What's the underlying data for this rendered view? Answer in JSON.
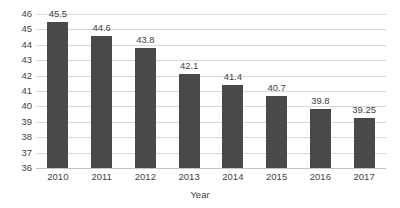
{
  "chart_data": {
    "type": "bar",
    "title": "",
    "xlabel": "Year",
    "ylabel": "Gallons",
    "categories": [
      "2010",
      "2011",
      "2012",
      "2013",
      "2014",
      "2015",
      "2016",
      "2017"
    ],
    "values": [
      45.5,
      44.6,
      43.8,
      42.1,
      41.4,
      40.7,
      39.8,
      39.25
    ],
    "data_labels": [
      "45.5",
      "44.6",
      "43.8",
      "42.1",
      "41.4",
      "40.7",
      "39.8",
      "39.25"
    ],
    "ylim": [
      36,
      46
    ],
    "ytick_labels": [
      "46",
      "45",
      "44",
      "43",
      "42",
      "41",
      "40",
      "39",
      "38",
      "37",
      "36"
    ],
    "ytick_values": [
      46,
      45,
      44,
      43,
      42,
      41,
      40,
      39,
      38,
      37,
      36
    ],
    "grid": true,
    "legend": false,
    "bar_color": "#494949",
    "gridline_color": "#d9d9d9",
    "text_color": "#3f3f3f",
    "background_color": "#ffffff"
  }
}
